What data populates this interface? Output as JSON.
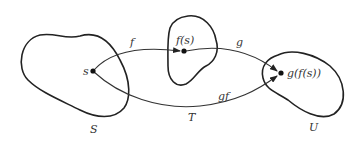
{
  "diagram": {
    "sets": [
      {
        "name": "S",
        "label": "S"
      },
      {
        "name": "T",
        "label": "T"
      },
      {
        "name": "U",
        "label": "U"
      }
    ],
    "points": [
      {
        "name": "s",
        "label": "s"
      },
      {
        "name": "f(s)",
        "label": "f(s)"
      },
      {
        "name": "g(f(s))",
        "label": "g(f(s))"
      }
    ],
    "maps": [
      {
        "name": "f",
        "label": "f",
        "from": "s",
        "to": "f(s)"
      },
      {
        "name": "g",
        "label": "g",
        "from": "f(s)",
        "to": "g(f(s))"
      },
      {
        "name": "gf",
        "label": "gf",
        "from": "s",
        "to": "g(f(s))"
      }
    ],
    "colors": {
      "stroke": "#222222",
      "text": "#333333",
      "background": "#ffffff"
    }
  }
}
